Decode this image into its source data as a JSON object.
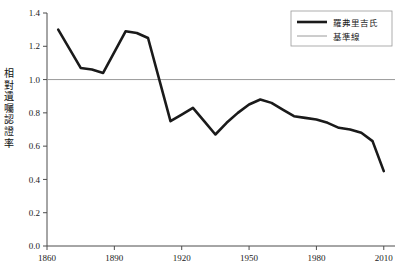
{
  "chart_data": {
    "type": "line",
    "title": "",
    "xlabel": "",
    "ylabel": "相對遺囑認證率",
    "xlim": [
      1860,
      2015
    ],
    "ylim": [
      0.0,
      1.4
    ],
    "grid": false,
    "legend_position": "top-right",
    "x_ticks": [
      "1860",
      "1890",
      "1920",
      "1950",
      "1980",
      "2010"
    ],
    "x_tick_values": [
      1860,
      1890,
      1920,
      1950,
      1980,
      2010
    ],
    "y_ticks": [
      "0.0",
      "0.2",
      "0.4",
      "0.6",
      "0.8",
      "1.0",
      "1.2",
      "1.4"
    ],
    "y_tick_values": [
      0.0,
      0.2,
      0.4,
      0.6,
      0.8,
      1.0,
      1.2,
      1.4
    ],
    "series": [
      {
        "name": "羅弗里吉氏",
        "color": "#1a1a1a",
        "width": 2.6,
        "x": [
          1865,
          1875,
          1880,
          1885,
          1895,
          1900,
          1905,
          1915,
          1920,
          1925,
          1930,
          1935,
          1940,
          1945,
          1950,
          1955,
          1960,
          1965,
          1970,
          1975,
          1980,
          1985,
          1990,
          1995,
          2000,
          2005,
          2010
        ],
        "values": [
          1.3,
          1.07,
          1.06,
          1.04,
          1.29,
          1.28,
          1.25,
          0.75,
          0.79,
          0.83,
          0.75,
          0.67,
          0.74,
          0.8,
          0.85,
          0.88,
          0.86,
          0.82,
          0.78,
          0.77,
          0.76,
          0.74,
          0.71,
          0.7,
          0.68,
          0.63,
          0.45
        ]
      },
      {
        "name": "基準線",
        "color": "#9a9a9a",
        "width": 1.0,
        "constant_y": 1.0,
        "x": [
          1860,
          2015
        ],
        "values": [
          1.0,
          1.0
        ]
      }
    ]
  },
  "legend": {
    "entries": [
      {
        "label": "羅弗里吉氏",
        "swatch": "thick-black-line"
      },
      {
        "label": "基準線",
        "swatch": "thin-gray-line"
      }
    ]
  },
  "axis": {
    "y_label_chars": [
      "相",
      "對",
      "遺",
      "囑",
      "認",
      "證",
      "率"
    ]
  }
}
